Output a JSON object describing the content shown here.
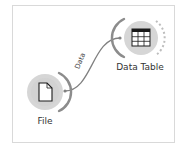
{
  "canvas": {
    "background": "#ffffff",
    "frame_border": "#d9d9d9"
  },
  "nodes": [
    {
      "id": "file",
      "title": "File",
      "icon": "file-icon",
      "circle_color": "#d4d4d4",
      "center": [
        45,
        92
      ],
      "radius": 18,
      "has_input": false,
      "has_output": true
    },
    {
      "id": "data-table",
      "title": "Data Table",
      "icon": "table-icon",
      "circle_color": "#d4d4d4",
      "center": [
        141,
        38
      ],
      "radius": 17,
      "has_input": true,
      "has_output": true
    }
  ],
  "links": [
    {
      "from": "file",
      "to": "data-table",
      "label": "Data",
      "color": "#808080"
    }
  ]
}
